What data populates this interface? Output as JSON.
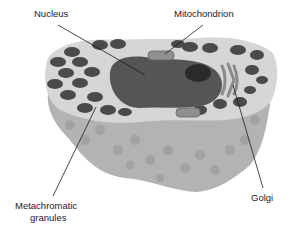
{
  "diagram": {
    "labels": {
      "nucleus": "Nucleus",
      "mitochondrion": "Mitochondrion",
      "metachromatic_line1": "Metachromatic",
      "metachromatic_line2": "granules",
      "golgi": "Golgi"
    },
    "colors": {
      "cytoplasm_top": "#d9d9d9",
      "cell_body_side": "#b0b0b0",
      "granule": "#4a4a4a",
      "nucleus": "#505050",
      "nucleolus": "#2a2a2a",
      "golgi": "#8a8a8a",
      "leader_line": "#1a1a1a"
    }
  }
}
